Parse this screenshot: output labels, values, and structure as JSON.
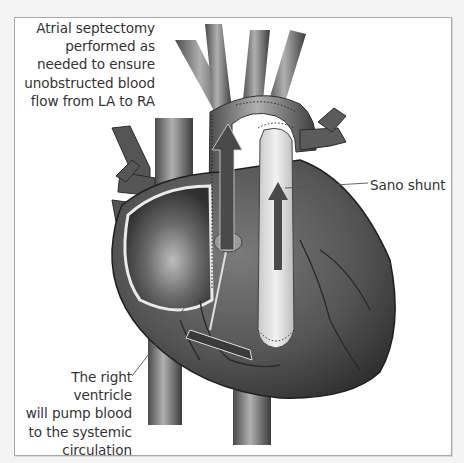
{
  "figure": {
    "style": "grayscale medical illustration",
    "colors": {
      "background": "#ffffff",
      "outer_background": "#f4f4f4",
      "frame_border": "#a8a8a8",
      "label_text": "#333333",
      "leader_line": "#555555"
    }
  },
  "labels": {
    "atrial_septectomy": {
      "lines": [
        "Atrial septectomy",
        "performed as",
        "needed to ensure",
        "unobstructed blood",
        "flow from LA to RA"
      ]
    },
    "sano_shunt": {
      "lines": [
        "Sano shunt"
      ]
    },
    "right_ventricle": {
      "lines": [
        "The right ventricle",
        "will pump blood",
        "to the systemic",
        "circulation"
      ]
    }
  }
}
